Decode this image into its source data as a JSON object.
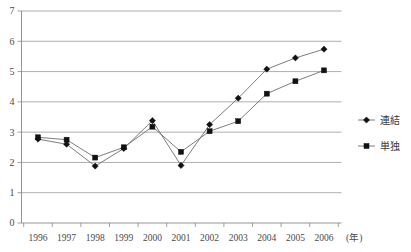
{
  "chart_data": {
    "type": "line",
    "title": "",
    "xlabel": "(年)",
    "ylabel": "",
    "categories": [
      "1996",
      "1997",
      "1998",
      "1999",
      "2000",
      "2001",
      "2002",
      "2003",
      "2004",
      "2005",
      "2006"
    ],
    "x_unit_label": "(年)",
    "ylim": [
      0,
      7
    ],
    "yticks": [
      "0",
      "1",
      "2",
      "3",
      "4",
      "5",
      "6",
      "7"
    ],
    "grid": true,
    "legend_position": "right",
    "series": [
      {
        "name": "連結",
        "marker": "diamond",
        "color": "#111111",
        "values": [
          2.77,
          2.6,
          1.88,
          2.46,
          3.38,
          1.9,
          3.25,
          4.12,
          5.08,
          5.45,
          5.74
        ]
      },
      {
        "name": "単独",
        "marker": "square",
        "color": "#111111",
        "values": [
          2.83,
          2.75,
          2.16,
          2.5,
          3.18,
          2.35,
          3.03,
          3.36,
          4.27,
          4.68,
          5.04
        ]
      }
    ]
  },
  "legend": {
    "items": [
      {
        "label": "連結",
        "marker": "diamond"
      },
      {
        "label": "単独",
        "marker": "square"
      }
    ]
  },
  "axes": {
    "y_tick_labels": [
      "7",
      "6",
      "5",
      "4",
      "3",
      "2",
      "1",
      "0"
    ],
    "x_tick_labels": [
      "1996",
      "1997",
      "1998",
      "1999",
      "2000",
      "2001",
      "2002",
      "2003",
      "2004",
      "2005",
      "2006"
    ],
    "x_unit": "(年)"
  },
  "colors": {
    "marker": "#111111",
    "line": "#6e6e6e",
    "grid": "#9a9a9a",
    "axis": "#8a8a8a",
    "text": "#3a3a3a",
    "background": "#ffffff"
  }
}
